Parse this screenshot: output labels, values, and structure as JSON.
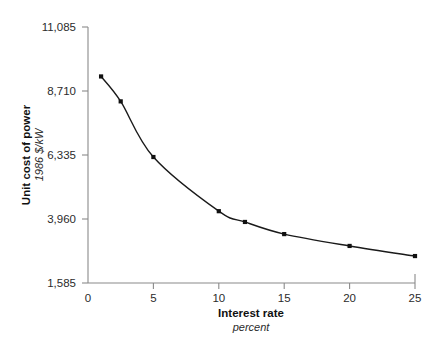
{
  "chart_data": {
    "type": "line",
    "title": "",
    "xlabel": "Interest rate",
    "xlabel_sub": "percent",
    "ylabel": "Unit cost of power",
    "ylabel_sub": "1986 $/kW",
    "xlim": [
      0,
      25
    ],
    "ylim": [
      1585,
      11085
    ],
    "xticks": [
      0,
      5,
      10,
      15,
      20,
      25
    ],
    "xticklabels": [
      "0",
      "5",
      "10",
      "15",
      "20",
      "25"
    ],
    "yticks": [
      1585,
      3960,
      6335,
      8710,
      11085
    ],
    "yticklabels": [
      "1,585",
      "3,960",
      "6,335",
      "8,710",
      "11,085"
    ],
    "grid": false,
    "legend": false,
    "series": [
      {
        "name": "Unit cost of power",
        "marker": "square",
        "color": "#111111",
        "x": [
          1,
          2.5,
          5,
          10,
          12,
          15,
          20,
          25
        ],
        "y": [
          9250,
          8325,
          6260,
          4250,
          3850,
          3400,
          2960,
          2585
        ]
      }
    ]
  }
}
